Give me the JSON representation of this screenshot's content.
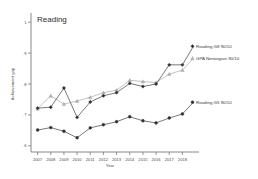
{
  "chart_data": {
    "type": "line",
    "title": "Reading",
    "xlabel": "Year",
    "ylabel": "Achievement gap",
    "x": [
      2007,
      2008,
      2009,
      2010,
      2011,
      2012,
      2013,
      2014,
      2015,
      2016,
      2017,
      2018
    ],
    "xticklabels": [
      "2007",
      "2008",
      "2009",
      "2010",
      "2011",
      "2012",
      "2013",
      "2014",
      "2015",
      "2016",
      "2017",
      "2018"
    ],
    "yticklabels": [
      "1",
      ".9",
      ".8",
      ".7",
      ".6"
    ],
    "ytickvalues": [
      1,
      0.9,
      0.8,
      0.7,
      0.6
    ],
    "ylim": [
      0.58,
      1.02
    ],
    "xlim": [
      2006.5,
      2018.5
    ],
    "grid": false,
    "legend_position": "right-inline",
    "series": [
      {
        "name": "Reading G8 90/10",
        "color": "#4b4b57",
        "marker": "diamond",
        "values": [
          0.722,
          0.725,
          0.787,
          0.692,
          0.742,
          0.762,
          0.772,
          0.802,
          0.792,
          0.8,
          0.862,
          0.862
        ]
      },
      {
        "name": "GPA Norwegian 90/10",
        "color": "#adadad",
        "marker": "triangle",
        "values": [
          0.72,
          0.762,
          0.735,
          0.745,
          0.757,
          0.772,
          0.78,
          0.812,
          0.808,
          0.805,
          0.832,
          0.845
        ]
      },
      {
        "name": "Reading G5 90/10",
        "color": "#2f2f3a",
        "marker": "circle",
        "values": [
          0.651,
          0.659,
          0.647,
          0.626,
          0.658,
          0.668,
          0.678,
          0.694,
          0.681,
          0.674,
          0.69,
          0.703
        ]
      }
    ]
  },
  "legend": {
    "items": [
      {
        "label": "Reading G8 90/10"
      },
      {
        "label": "GPA Norwegian 90/10"
      },
      {
        "label": "Reading G5 90/10"
      }
    ]
  }
}
